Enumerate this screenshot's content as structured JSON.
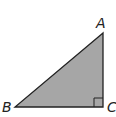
{
  "diagram": {
    "type": "right-triangle",
    "vertices": [
      {
        "label": "A",
        "x": 103,
        "y": 33
      },
      {
        "label": "B",
        "x": 15,
        "y": 107
      },
      {
        "label": "C",
        "x": 103,
        "y": 107
      }
    ],
    "right_angle_at": "C",
    "fill_color": "#a6a6a6",
    "stroke_color": "#222222"
  },
  "labels": {
    "a": "A",
    "b": "B",
    "c": "C"
  }
}
